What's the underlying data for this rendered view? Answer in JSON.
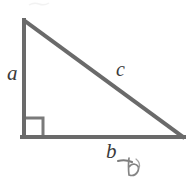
{
  "figure": {
    "name": "right-triangle-diagram",
    "background_color": "#ffffff",
    "stroke_color": "#6a6a6a",
    "stroke_color_dark": "#555555",
    "label_color": "#3a3a3a",
    "stroke_width": 4,
    "right_angle_marker": {
      "name": "right-angle-marker",
      "visible": true,
      "size": 17
    },
    "vertices": {
      "apex": [
        24,
        20
      ],
      "right_angle": [
        24,
        137
      ],
      "base_right": [
        183,
        137
      ]
    },
    "labels": {
      "leg_vertical": "a",
      "hypotenuse": "c",
      "leg_horizontal": "b"
    },
    "annotations": {
      "pencil_mark": "b",
      "pencil_mark_visible": true,
      "top_smudge_visible": true
    }
  }
}
